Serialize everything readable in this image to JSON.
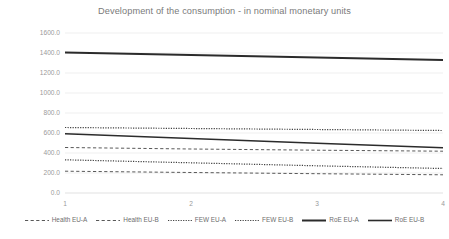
{
  "chart_data": {
    "type": "line",
    "title": "Development of the consumption - in nominal monetary units",
    "xlabel": "",
    "ylabel": "",
    "x": [
      1,
      2,
      3,
      4
    ],
    "categories": [
      "1",
      "2",
      "3",
      "4"
    ],
    "xtick_labels": [
      "1",
      "2",
      "3",
      "4"
    ],
    "ytick_labels": [
      "1600.0",
      "1400.0",
      "1200.0",
      "1000.0",
      "800.0",
      "600.0",
      "400.0",
      "200.0",
      "0.0"
    ],
    "ytick_values": [
      1600,
      1400,
      1200,
      1000,
      800,
      600,
      400,
      200,
      0
    ],
    "ylim": [
      0,
      1600
    ],
    "grid": true,
    "legend_position": "bottom",
    "series": [
      {
        "name": "Health EU-A",
        "style": "dashed",
        "color": "#595959",
        "width": 1.0,
        "values": [
          455,
          440,
          428,
          418
        ]
      },
      {
        "name": "Health EU-B",
        "style": "dashed",
        "color": "#595959",
        "width": 1.0,
        "values": [
          218,
          205,
          193,
          182
        ]
      },
      {
        "name": "FEW EU-A",
        "style": "dotted",
        "color": "#404040",
        "width": 1.2,
        "values": [
          655,
          645,
          635,
          625
        ]
      },
      {
        "name": "FEW EU-B",
        "style": "dotted",
        "color": "#404040",
        "width": 1.2,
        "values": [
          332,
          302,
          272,
          245
        ]
      },
      {
        "name": "RoE EU-A",
        "style": "solid",
        "color": "#2b2b2b",
        "width": 2.0,
        "values": [
          1405,
          1380,
          1355,
          1330
        ]
      },
      {
        "name": "RoE EU-B",
        "style": "solid",
        "color": "#2b2b2b",
        "width": 1.6,
        "values": [
          592,
          545,
          498,
          452
        ]
      }
    ]
  },
  "legend": {
    "items": [
      {
        "label": "Health EU-A",
        "style": "dashed",
        "color": "#595959"
      },
      {
        "label": "Health EU-B",
        "style": "dashed",
        "color": "#595959"
      },
      {
        "label": "FEW EU-A",
        "style": "dotted",
        "color": "#404040"
      },
      {
        "label": "FEW EU-B",
        "style": "dotted",
        "color": "#404040"
      },
      {
        "label": "RoE EU-A",
        "style": "solid",
        "color": "#2b2b2b"
      },
      {
        "label": "RoE EU-B",
        "style": "solid",
        "color": "#2b2b2b"
      }
    ]
  },
  "theme": {
    "background": "#ffffff",
    "grid_color": "#e8e8e8",
    "axis_color": "#d9d9d9",
    "title_color": "#7a7a7a",
    "tick_color": "#9a9a9a"
  }
}
